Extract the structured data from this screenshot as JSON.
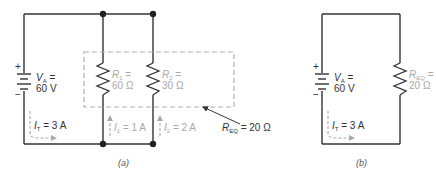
{
  "figure": {
    "panel_a": {
      "caption": "(a)",
      "source": {
        "symbol": "V",
        "subscript": "A",
        "eq": " =",
        "value": "60 V",
        "plus": "+",
        "minus": "−"
      },
      "total_current": {
        "symbol": "I",
        "subscript": "T",
        "value": " = 3 A"
      },
      "resistors": [
        {
          "symbol": "R",
          "subscript": "1",
          "eq": " =",
          "value": "60 Ω",
          "current_symbol": "I",
          "current_subscript": "1",
          "current_value": " = 1 A"
        },
        {
          "symbol": "R",
          "subscript": "2",
          "eq": " =",
          "value": "30 Ω",
          "current_symbol": "I",
          "current_subscript": "2",
          "current_value": " = 2 A"
        }
      ],
      "equivalent": {
        "symbol": "R",
        "subscript": "EQ",
        "value": " = 20 Ω"
      }
    },
    "panel_b": {
      "caption": "(b)",
      "source": {
        "symbol": "V",
        "subscript": "A",
        "eq": " =",
        "value": "60 V",
        "plus": "+",
        "minus": "−"
      },
      "total_current": {
        "symbol": "I",
        "subscript": "T",
        "value": " = 3 A"
      },
      "resistor": {
        "symbol": "R",
        "subscript": "EQ",
        "eq": " =",
        "value": "20 Ω"
      }
    },
    "colors": {
      "wire": "#333333",
      "label_light": "#a8a8a8",
      "dashed_box": "#b0b0b0"
    }
  }
}
